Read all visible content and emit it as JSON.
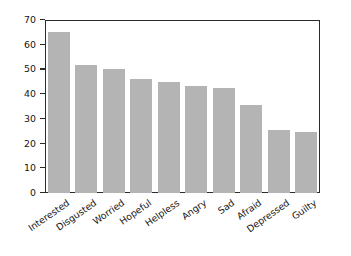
{
  "chart_data": {
    "type": "bar",
    "title": "",
    "subtitle": "",
    "xlabel": "",
    "ylabel": "Percent of respondents",
    "categories": [
      "Interested",
      "Disgusted",
      "Worried",
      "Hopeful",
      "Helpless",
      "Angry",
      "Sad",
      "Afraid",
      "Depressed",
      "Guilty"
    ],
    "values": [
      65,
      52,
      50,
      46,
      45,
      43.5,
      42.5,
      35.5,
      25.5,
      24.5
    ],
    "ylim": [
      0,
      70
    ],
    "ytick_labels": [
      "0",
      "10",
      "20",
      "30",
      "40",
      "50",
      "60",
      "70"
    ],
    "ytick_values": [
      0,
      10,
      20,
      30,
      40,
      50,
      60,
      70
    ],
    "grid": false,
    "legend": false,
    "legend_position": "none",
    "bar_color": "#b4b4b4",
    "axis_color": "#2b2b2b",
    "background_color": "#ffffff",
    "xtick_label_rotation": -35
  }
}
